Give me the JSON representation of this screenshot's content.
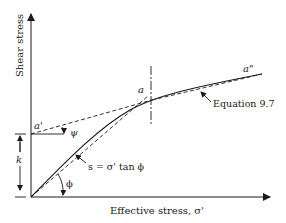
{
  "diagram": {
    "type": "shear-strength-envelope",
    "y_axis_label": "Shear stress",
    "x_axis_label": "Effective stress, σ'",
    "labels": {
      "a_prime": "a'",
      "a": "a",
      "a_double_prime": "a\"",
      "psi": "ψ",
      "k": "k",
      "phi": "ϕ",
      "linear_envelope": "s = σ' tan ϕ",
      "curve": "Equation 9.7"
    },
    "colors": {
      "ink": "#1a1a1a",
      "background": "#ffffff"
    }
  }
}
